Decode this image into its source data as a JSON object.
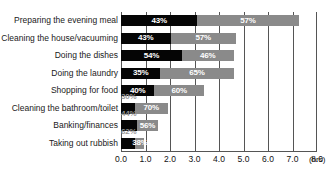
{
  "chart_data": {
    "type": "bar",
    "subtype": "stacked-horizontal-100pct-with-total-length",
    "title": "",
    "xlabel": "(hrs)",
    "ylabel": "",
    "xlim": [
      0.0,
      8.0
    ],
    "xticks": [
      "0.0",
      "1.0",
      "2.0",
      "3.0",
      "4.0",
      "5.0",
      "6.0",
      "7.0",
      "8.0"
    ],
    "grid": true,
    "legend": "none",
    "unit": "(hrs)",
    "categories": [
      "Preparing the evening meal",
      "Cleaning the house/vacuuming",
      "Doing the dishes",
      "Doing the laundry",
      "Shopping for food",
      "Cleaning the bathroom/toilet",
      "Banking/finances",
      "Taking out rubbish"
    ],
    "series": [
      {
        "name": "Segment A",
        "color": "#050505",
        "values": [
          43,
          43,
          54,
          35,
          40,
          30,
          44,
          62
        ],
        "labels": [
          "43%",
          "43%",
          "54%",
          "35%",
          "40%",
          "30%",
          "44%",
          "62%"
        ]
      },
      {
        "name": "Segment B",
        "color": "#8a8a8a",
        "values": [
          57,
          57,
          46,
          65,
          60,
          70,
          56,
          38
        ],
        "labels": [
          "57%",
          "57%",
          "46%",
          "65%",
          "60%",
          "70%",
          "56%",
          "38%"
        ]
      }
    ],
    "totals_hours": [
      7.25,
      4.7,
      4.6,
      4.6,
      3.4,
      1.9,
      1.5,
      0.95
    ]
  },
  "colors": {
    "segment_a": "#050505",
    "segment_b": "#8a8a8a",
    "axis": "#555555",
    "text": "#111111",
    "background": "#ffffff"
  }
}
